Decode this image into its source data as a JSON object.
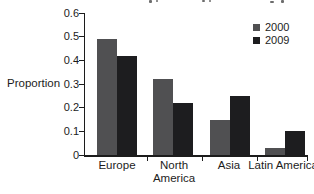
{
  "chart_data": {
    "type": "bar",
    "categories": [
      "Europe",
      "North America",
      "Asia",
      "Latin America"
    ],
    "series": [
      {
        "name": "2000",
        "color": "#505052",
        "values": [
          0.49,
          0.32,
          0.15,
          0.03
        ]
      },
      {
        "name": "2009",
        "color": "#1d1d1f",
        "values": [
          0.42,
          0.22,
          0.25,
          0.1
        ]
      }
    ],
    "title": "",
    "xlabel": "",
    "ylabel": "Proportion",
    "ylim": [
      0,
      0.6
    ],
    "y_tick_labels": [
      "0.6",
      "0.5",
      "0.4",
      "0.3",
      "0.2",
      "0.1",
      "0"
    ],
    "grid": false,
    "legend_position": "top-right",
    "axis_color": "#1c1c1c"
  }
}
